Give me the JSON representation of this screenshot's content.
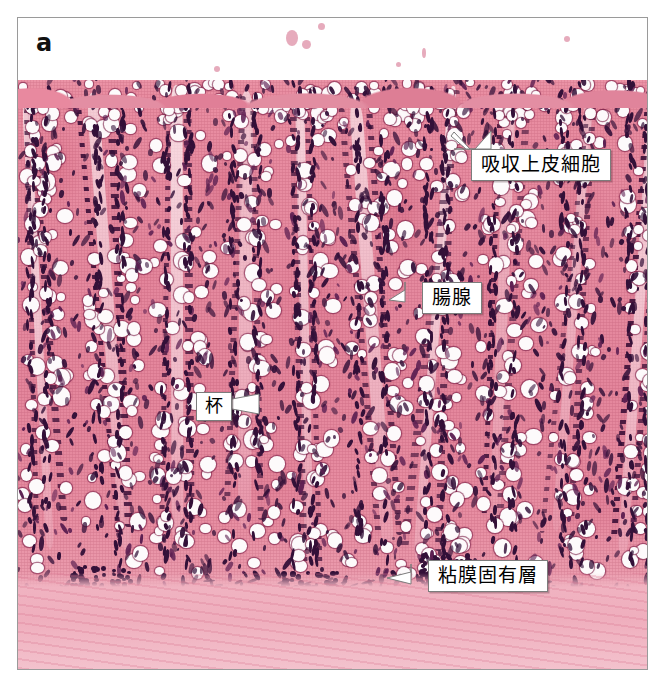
{
  "figure": {
    "panel_label": "a",
    "image_kind": "light-micrograph-he-stain"
  },
  "annotations": [
    {
      "id": "absorptive-epithelial-cells",
      "label": "吸収上皮細胞",
      "box": {
        "left": 453,
        "top": 131,
        "width": 146,
        "height": 32
      },
      "pointer_direction": "up-right"
    },
    {
      "id": "intestinal-gland",
      "label": "腸腺",
      "box": {
        "left": 404,
        "top": 264,
        "width": 62,
        "height": 32
      },
      "pointer_direction": "down-left"
    },
    {
      "id": "goblet-cell",
      "label": "杯",
      "box": {
        "left": 178,
        "top": 374,
        "width": 36,
        "height": 32
      },
      "pointer_direction": "right"
    },
    {
      "id": "lamina-propria",
      "label": "粘膜固有層",
      "box": {
        "left": 410,
        "top": 542,
        "width": 124,
        "height": 32
      },
      "pointer_direction": "down-left"
    }
  ],
  "colors": {
    "stain_pink": "#e68ba0",
    "nucleus_purple": "#331038",
    "goblet_white": "#fdfafb",
    "frame_border": "#9a9a9a",
    "callout_border": "#7c7c7c",
    "page_background": "#ffffff"
  }
}
